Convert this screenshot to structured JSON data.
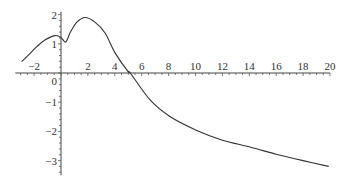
{
  "chart_data": {
    "type": "line",
    "title": "",
    "xlabel": "",
    "ylabel": "",
    "xlim": [
      -3.4,
      20
    ],
    "ylim": [
      -3.5,
      2.1
    ],
    "grid": false,
    "legend": "none",
    "x_ticks": [
      -2,
      2,
      4,
      6,
      8,
      10,
      12,
      14,
      16,
      18,
      20
    ],
    "x_tick_labels": [
      "−2",
      "2",
      "4",
      "6",
      "8",
      "10",
      "12",
      "14",
      "16",
      "18",
      "20"
    ],
    "x_minor_step": 0.5,
    "y_ticks": [
      2,
      1,
      0,
      -1,
      -2,
      -3
    ],
    "y_tick_labels": [
      "2",
      "1",
      "0",
      "−1",
      "−2",
      "−3"
    ],
    "y_minor_step": 0.2,
    "series": [
      {
        "name": "f(x)",
        "x": [
          -2.93,
          -2.4,
          -1.8,
          -1.2,
          -0.45,
          0.0,
          0.35,
          0.7,
          1.2,
          1.79,
          2.5,
          3.28,
          4.03,
          5.0,
          5.15,
          6.64,
          8.13,
          10.1,
          12.0,
          14.1,
          16.0,
          18.0,
          19.9
        ],
        "y": [
          0.39,
          0.62,
          0.9,
          1.13,
          1.28,
          1.22,
          1.06,
          1.4,
          1.75,
          1.9,
          1.75,
          1.37,
          0.68,
          0.04,
          0.0,
          -0.93,
          -1.5,
          -1.97,
          -2.3,
          -2.54,
          -2.78,
          -3.0,
          -3.2
        ]
      }
    ]
  }
}
